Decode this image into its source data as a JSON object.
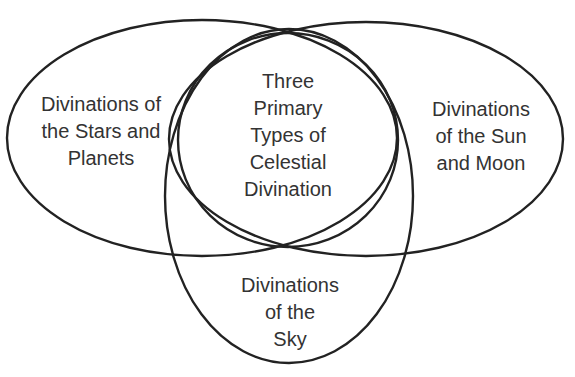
{
  "diagram": {
    "type": "venn",
    "stroke_color": "#222222",
    "text_color": "#333333",
    "background": "#ffffff",
    "sets": [
      {
        "id": "stars-planets",
        "lines": [
          "Divinations of",
          "the Stars and",
          "Planets"
        ]
      },
      {
        "id": "center",
        "lines": [
          "Three",
          "Primary",
          "Types of",
          "Celestial",
          "Divination"
        ]
      },
      {
        "id": "sun-moon",
        "lines": [
          "Divinations",
          "of the Sun",
          "and Moon"
        ]
      },
      {
        "id": "sky",
        "lines": [
          "Divinations",
          "of the",
          "Sky"
        ]
      }
    ]
  }
}
